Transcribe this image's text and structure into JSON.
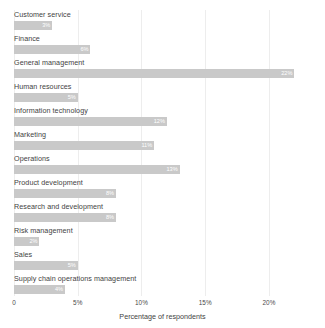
{
  "chart_data": {
    "type": "bar",
    "orientation": "horizontal",
    "title": "",
    "xlabel": "Percentage of respondents",
    "ylabel": "",
    "xlim": [
      0,
      23.3
    ],
    "grid": true,
    "legend": null,
    "xticks": [
      "0",
      "5%",
      "10%",
      "15%",
      "20%"
    ],
    "xtick_values": [
      0,
      5,
      10,
      15,
      20
    ],
    "categories": [
      "Customer service",
      "Finance",
      "General management",
      "Human resources",
      "Information technology",
      "Marketing",
      "Operations",
      "Product development",
      "Research and development",
      "Risk management",
      "Sales",
      "Supply chain operations management"
    ],
    "values": [
      3,
      6,
      22,
      5,
      12,
      11,
      13,
      8,
      8,
      2,
      5,
      4
    ],
    "data_labels": [
      "3%",
      "6%",
      "22%",
      "5%",
      "12%",
      "11%",
      "13%",
      "8%",
      "8%",
      "2%",
      "5%",
      "4%"
    ],
    "bar_color": "#c9c9c9",
    "gridline_color": "#ededed",
    "label_color": "#ffffff"
  }
}
